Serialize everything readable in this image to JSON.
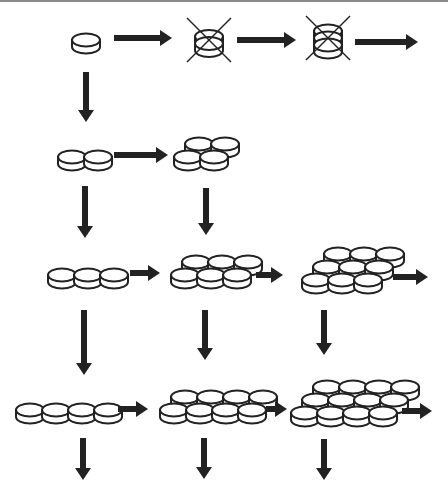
{
  "diagram": {
    "title": "",
    "colors": {
      "stroke": "#222222",
      "fill": "#ffffff",
      "arrow": "#222222",
      "topline": "#8a8a8a"
    },
    "disc": {
      "rx": 14,
      "ry": 6.5,
      "thickness": 7
    },
    "nodes": [
      {
        "id": "n1x1",
        "label": "1 disc",
        "cols": 1,
        "rows": 1,
        "layers": 1,
        "x": 86,
        "y": 40,
        "crossed": false
      },
      {
        "id": "n1x1x2",
        "label": "2 stacked",
        "cols": 1,
        "rows": 1,
        "layers": 2,
        "x": 209,
        "y": 40,
        "crossed": true
      },
      {
        "id": "n1x1x3",
        "label": "3 stacked",
        "cols": 1,
        "rows": 1,
        "layers": 3,
        "x": 328,
        "y": 38,
        "crossed": true
      },
      {
        "id": "n2x1",
        "label": "2 discs row",
        "cols": 2,
        "rows": 1,
        "layers": 1,
        "x": 72,
        "y": 157,
        "crossed": false
      },
      {
        "id": "n2x2",
        "label": "2x2 discs",
        "cols": 2,
        "rows": 2,
        "layers": 1,
        "x": 188,
        "y": 157,
        "crossed": false
      },
      {
        "id": "n3x1",
        "label": "3 discs row",
        "cols": 3,
        "rows": 1,
        "layers": 1,
        "x": 62,
        "y": 275,
        "crossed": false
      },
      {
        "id": "n3x2",
        "label": "3x2 discs",
        "cols": 3,
        "rows": 2,
        "layers": 1,
        "x": 185,
        "y": 275,
        "crossed": false
      },
      {
        "id": "n3x3",
        "label": "3x3 discs",
        "cols": 3,
        "rows": 3,
        "layers": 1,
        "x": 316,
        "y": 280,
        "crossed": false
      },
      {
        "id": "n4x1",
        "label": "4 discs row",
        "cols": 4,
        "rows": 1,
        "layers": 1,
        "x": 30,
        "y": 410,
        "crossed": false
      },
      {
        "id": "n4x2",
        "label": "4x2 discs",
        "cols": 4,
        "rows": 2,
        "layers": 1,
        "x": 174,
        "y": 410,
        "crossed": false
      },
      {
        "id": "n4x3",
        "label": "4x3 discs",
        "cols": 4,
        "rows": 3,
        "layers": 1,
        "x": 305,
        "y": 413,
        "crossed": false
      }
    ],
    "arrows": [
      {
        "dir": "right",
        "x1": 114,
        "y1": 38,
        "x2": 172,
        "y2": 38
      },
      {
        "dir": "right",
        "x1": 237,
        "y1": 40,
        "x2": 296,
        "y2": 40
      },
      {
        "dir": "right",
        "x1": 355,
        "y1": 42,
        "x2": 418,
        "y2": 42
      },
      {
        "dir": "down",
        "x1": 86,
        "y1": 72,
        "x2": 86,
        "y2": 122
      },
      {
        "dir": "right",
        "x1": 114,
        "y1": 155,
        "x2": 168,
        "y2": 155
      },
      {
        "dir": "down",
        "x1": 85,
        "y1": 186,
        "x2": 85,
        "y2": 238
      },
      {
        "dir": "down",
        "x1": 206,
        "y1": 188,
        "x2": 206,
        "y2": 235
      },
      {
        "dir": "right",
        "x1": 130,
        "y1": 273,
        "x2": 160,
        "y2": 273
      },
      {
        "dir": "right",
        "x1": 256,
        "y1": 275,
        "x2": 283,
        "y2": 275
      },
      {
        "dir": "right",
        "x1": 393,
        "y1": 277,
        "x2": 428,
        "y2": 277
      },
      {
        "dir": "down",
        "x1": 84,
        "y1": 310,
        "x2": 84,
        "y2": 375
      },
      {
        "dir": "down",
        "x1": 205,
        "y1": 310,
        "x2": 205,
        "y2": 360
      },
      {
        "dir": "down",
        "x1": 324,
        "y1": 310,
        "x2": 324,
        "y2": 355
      },
      {
        "dir": "right",
        "x1": 118,
        "y1": 409,
        "x2": 148,
        "y2": 409
      },
      {
        "dir": "right",
        "x1": 266,
        "y1": 409,
        "x2": 287,
        "y2": 409
      },
      {
        "dir": "right",
        "x1": 402,
        "y1": 411,
        "x2": 432,
        "y2": 411
      },
      {
        "dir": "down",
        "x1": 83,
        "y1": 438,
        "x2": 83,
        "y2": 480
      },
      {
        "dir": "down",
        "x1": 204,
        "y1": 438,
        "x2": 204,
        "y2": 479
      },
      {
        "dir": "down",
        "x1": 324,
        "y1": 439,
        "x2": 324,
        "y2": 480
      }
    ]
  }
}
